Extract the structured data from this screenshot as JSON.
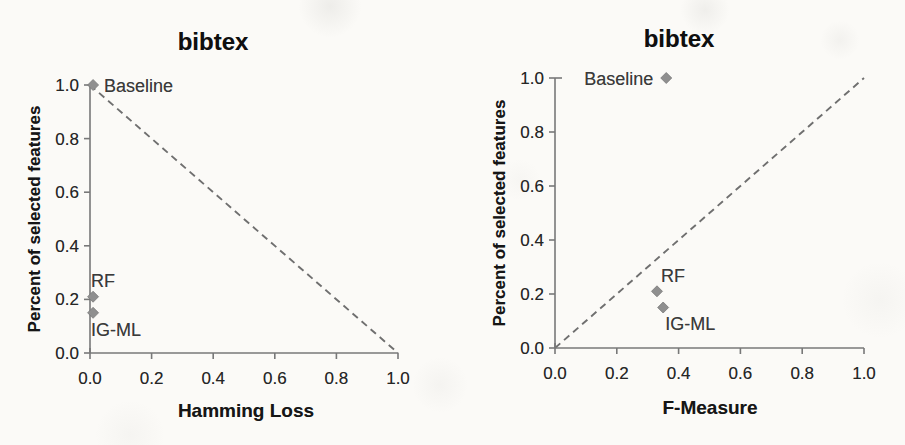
{
  "figure_background": "#fbfaf7",
  "colors": {
    "axis": "#787878",
    "tick_text": "#262626",
    "title_text": "#0f0f0f",
    "marker_fill": "#8f8f8f",
    "marker_stroke": "#7a7a7a",
    "dash_line": "#6f6f6f",
    "point_label_text": "#3a3a3a"
  },
  "chart_data": [
    {
      "type": "scatter",
      "title": "bibtex",
      "xlabel": "Hamming Loss",
      "ylabel": "Percent of selected features",
      "xlim": [
        0.0,
        1.0
      ],
      "ylim": [
        0.0,
        1.0
      ],
      "xticks": [
        "0.0",
        "0.2",
        "0.4",
        "0.6",
        "0.8",
        "1.0"
      ],
      "yticks": [
        "0.0",
        "0.2",
        "0.4",
        "0.6",
        "0.8",
        "1.0"
      ],
      "grid": false,
      "legend": "none",
      "marker": "diamond",
      "series": [
        {
          "name": "Baseline",
          "x": 0.01,
          "y": 1.0
        },
        {
          "name": "RF",
          "x": 0.01,
          "y": 0.21
        },
        {
          "name": "IG-ML",
          "x": 0.01,
          "y": 0.15
        }
      ],
      "reference_line": {
        "style": "dashed",
        "from_xy": [
          0.0,
          1.0
        ],
        "to_xy": [
          1.0,
          0.0
        ]
      }
    },
    {
      "type": "scatter",
      "title": "bibtex",
      "xlabel": "F-Measure",
      "ylabel": "Percent of selected features",
      "xlim": [
        0.0,
        1.0
      ],
      "ylim": [
        0.0,
        1.0
      ],
      "xticks": [
        "0.0",
        "0.2",
        "0.4",
        "0.6",
        "0.8",
        "1.0"
      ],
      "yticks": [
        "0.0",
        "0.2",
        "0.4",
        "0.6",
        "0.8",
        "1.0"
      ],
      "grid": false,
      "legend": "none",
      "marker": "diamond",
      "series": [
        {
          "name": "Baseline",
          "x": 0.36,
          "y": 1.0
        },
        {
          "name": "RF",
          "x": 0.33,
          "y": 0.21
        },
        {
          "name": "IG-ML",
          "x": 0.35,
          "y": 0.15
        }
      ],
      "reference_line": {
        "style": "dashed",
        "from_xy": [
          0.0,
          0.0
        ],
        "to_xy": [
          1.0,
          1.0
        ]
      }
    }
  ]
}
